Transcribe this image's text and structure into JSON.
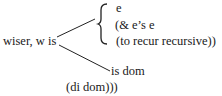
{
  "diagram": {
    "root": "wiser, w is",
    "upper_branch": {
      "lines": [
        "e",
        "(& e’s e",
        "(to recur recursive))"
      ]
    },
    "lower_branch": {
      "lines": [
        "is dom",
        "(di dom)))"
      ]
    }
  }
}
